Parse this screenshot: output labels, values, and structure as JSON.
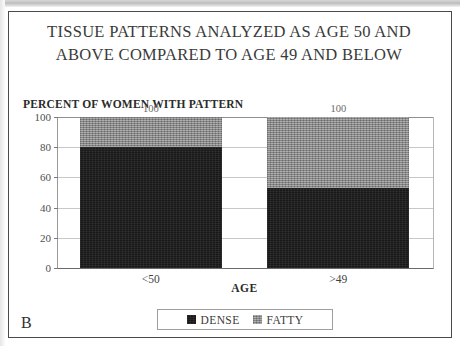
{
  "figure": {
    "panel_letter": "B",
    "title_line1": "TISSUE PATTERNS ANALYZED AS AGE 50 AND",
    "title_line2": "ABOVE COMPARED TO AGE 49 AND BELOW"
  },
  "chart_data": {
    "type": "bar",
    "stacked": true,
    "title": "TISSUE PATTERNS ANALYZED AS AGE 50 AND ABOVE COMPARED TO AGE 49 AND BELOW",
    "xlabel": "AGE",
    "ylabel": "PERCENT OF WOMEN WITH PATTERN",
    "categories": [
      "<50",
      ">49"
    ],
    "series": [
      {
        "name": "DENSE",
        "values": [
          80,
          53
        ],
        "color": "#181818"
      },
      {
        "name": "FATTY",
        "values": [
          20,
          47
        ],
        "color": "#8b8b8b"
      }
    ],
    "bar_total_labels": [
      "100",
      "100"
    ],
    "ylim": [
      0,
      100
    ],
    "yticks": [
      "0",
      "20",
      "40",
      "60",
      "80",
      "100"
    ],
    "grid": true,
    "legend_position": "bottom"
  }
}
